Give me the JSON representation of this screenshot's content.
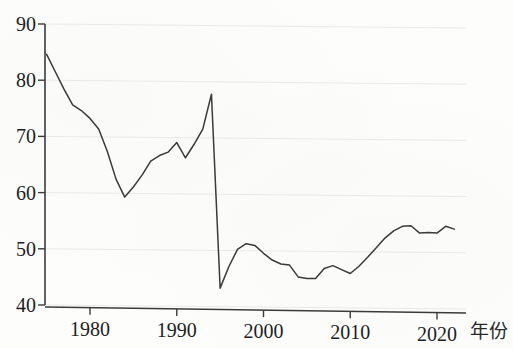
{
  "chart_data": {
    "type": "line",
    "title": "",
    "subtitle": "",
    "xlabel": "年份",
    "ylabel": "",
    "xlim": [
      1975,
      2023
    ],
    "ylim": [
      40,
      90
    ],
    "grid": true,
    "legend": false,
    "legend_position": "none",
    "y_ticks": [
      40,
      50,
      60,
      70,
      80,
      90
    ],
    "y_tick_labels": [
      "40",
      "50",
      "60",
      "70",
      "80",
      "90"
    ],
    "x_ticks": [
      1980,
      1990,
      2000,
      2010,
      2020
    ],
    "x_tick_labels": [
      "1980",
      "1990",
      "2000",
      "2010",
      "2020"
    ],
    "line_color": "#3a3a3a",
    "grid_color": "#ebe9e6",
    "axis_color": "#3b3b3b",
    "background_color": "#fdfdfc",
    "annotations": [],
    "series": [
      {
        "name": "series-1",
        "x": [
          1975,
          1976,
          1977,
          1978,
          1979,
          1980,
          1981,
          1982,
          1983,
          1984,
          1985,
          1986,
          1987,
          1988,
          1989,
          1990,
          1991,
          1992,
          1993,
          1994,
          1995,
          1996,
          1997,
          1998,
          1999,
          2000,
          2001,
          2002,
          2003,
          2004,
          2005,
          2006,
          2007,
          2008,
          2009,
          2010,
          2011,
          2012,
          2013,
          2014,
          2015,
          2016,
          2017,
          2018,
          2019,
          2020,
          2021,
          2022
        ],
        "values": [
          84.6,
          81.5,
          78.4,
          75.6,
          74.6,
          73.2,
          71.3,
          67.3,
          62.4,
          59.2,
          61.0,
          63.1,
          65.6,
          66.6,
          67.2,
          68.9,
          66.2,
          68.6,
          71.3,
          77.5,
          43.0,
          46.8,
          49.9,
          50.9,
          50.6,
          49.2,
          48.0,
          47.3,
          47.1,
          45.0,
          44.7,
          44.7,
          46.5,
          47.0,
          46.3,
          45.6,
          46.9,
          48.5,
          50.2,
          51.9,
          53.2,
          54.0,
          54.1,
          52.8,
          52.9,
          52.8,
          54.0,
          53.5
        ]
      }
    ]
  },
  "axis": {
    "x_title": "年份"
  }
}
